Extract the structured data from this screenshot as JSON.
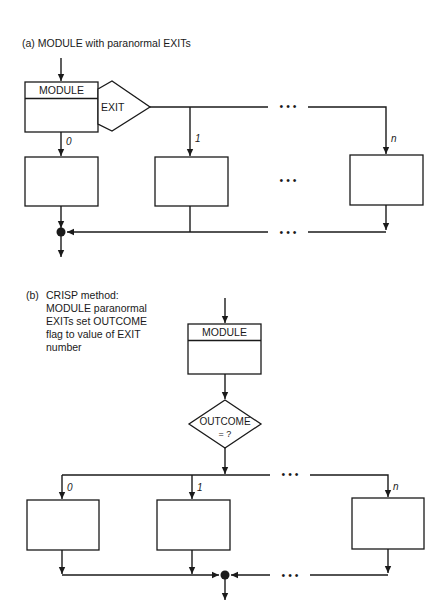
{
  "panel_a": {
    "caption": "(a)  MODULE with paranormal EXITs",
    "module_label": "MODULE",
    "decision_label": "EXIT",
    "branch_labels": [
      "0",
      "1",
      "n"
    ],
    "ellipsis": "• • •"
  },
  "panel_b": {
    "caption_prefix": "(b)",
    "caption_lines": [
      "CRISP method:",
      "MODULE paranormal",
      "EXITs set OUTCOME",
      "flag to value of  EXIT",
      "number"
    ],
    "module_label": "MODULE",
    "decision_label_lines": [
      "OUTCOME",
      "= ?"
    ],
    "branch_labels": [
      "0",
      "1",
      "n"
    ],
    "ellipsis": "• • •"
  }
}
